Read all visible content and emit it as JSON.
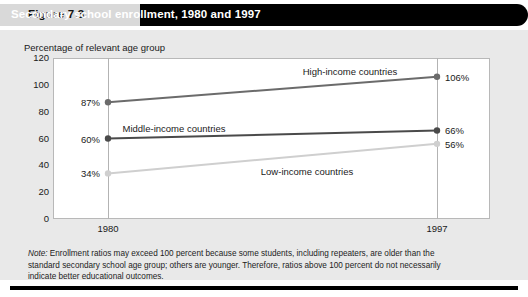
{
  "header": {
    "figure_label": "Figure 7.3",
    "title": "Secondary school enrollment, 1980 and 1997"
  },
  "note": {
    "prefix": "Note:",
    "text": " Enrollment ratios may exceed 100 percent because some students, including repeaters, are older than the standard secondary school age group; others are younger. Therefore, ratios above 100 percent do not necessarily indicate better educational outcomes."
  },
  "colors": {
    "high_income": "#6b6b6b",
    "middle_income": "#4a4a4a",
    "low_income": "#cfcfcf",
    "gridline": "#b3b3b3",
    "panel": "#e9e9e9",
    "title_bar": "#000000",
    "label_box": "#d9d9d9"
  },
  "chart_data": {
    "type": "line",
    "title": "Secondary school enrollment, 1980 and 1997",
    "ylabel": "Percentage of relevant age group",
    "xlabel": "",
    "x": [
      "1980",
      "1997"
    ],
    "categories": [
      "1980",
      "1997"
    ],
    "ylim": [
      0,
      120
    ],
    "yticks": [
      0,
      20,
      40,
      60,
      80,
      100,
      120
    ],
    "ytick_labels": [
      "0",
      "20",
      "40",
      "60",
      "80",
      "100",
      "120"
    ],
    "grid": "vertical-only",
    "legend": "inline-labels",
    "series": [
      {
        "name": "High-income countries",
        "values": [
          87,
          106
        ],
        "point_labels": [
          "87%",
          "106%"
        ],
        "color": "#6b6b6b"
      },
      {
        "name": "Middle-income countries",
        "values": [
          60,
          66
        ],
        "point_labels": [
          "60%",
          "66%"
        ],
        "color": "#4a4a4a"
      },
      {
        "name": "Low-income countries",
        "values": [
          34,
          56
        ],
        "point_labels": [
          "34%",
          "56%"
        ],
        "color": "#cfcfcf"
      }
    ]
  }
}
